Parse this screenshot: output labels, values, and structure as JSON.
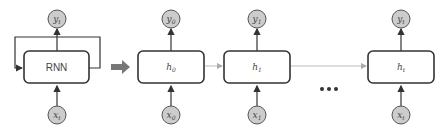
{
  "diagram": {
    "colors": {
      "box_stroke": "#333333",
      "circle_fill": "#cccccc",
      "circle_stroke": "#555555",
      "connector": "#bbbbbb",
      "arrow": "#777777"
    },
    "rolled": {
      "label": "RNN",
      "input": {
        "base": "x",
        "sub": "t"
      },
      "output": {
        "base": "y",
        "sub": "t"
      }
    },
    "unrolled": [
      {
        "hidden": {
          "base": "h",
          "sub": "0"
        },
        "input": {
          "base": "x",
          "sub": "0"
        },
        "output": {
          "base": "y",
          "sub": "0"
        }
      },
      {
        "hidden": {
          "base": "h",
          "sub": "1"
        },
        "input": {
          "base": "x",
          "sub": "1"
        },
        "output": {
          "base": "y",
          "sub": "1"
        }
      },
      {
        "hidden": {
          "base": "h",
          "sub": "t"
        },
        "input": {
          "base": "x",
          "sub": "t"
        },
        "output": {
          "base": "y",
          "sub": "t"
        }
      }
    ],
    "ellipsis": "•••"
  }
}
